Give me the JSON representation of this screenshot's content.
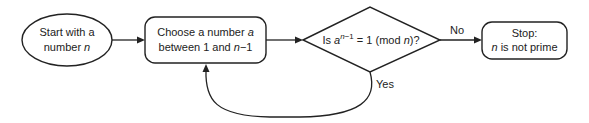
{
  "diagram": {
    "type": "flowchart",
    "nodes": {
      "start": {
        "shape": "ellipse",
        "line1": "Start with a",
        "line2_text": "number ",
        "line2_var": "n"
      },
      "choose": {
        "shape": "rounded-rectangle",
        "line1_text": "Choose a number ",
        "line1_var": "a",
        "line2_text": "between 1 and ",
        "line2_var": "n",
        "line2_suffix": "−1"
      },
      "test": {
        "shape": "diamond",
        "prefix": "Is ",
        "base": "a",
        "exp_var": "n",
        "exp_suffix": "−1",
        "middle": " = 1 (mod ",
        "mod_var": "n",
        "suffix": ")?"
      },
      "stop": {
        "shape": "rounded-rectangle",
        "line1": "Stop:",
        "line2_var": "n",
        "line2_text": " is not prime"
      }
    },
    "edges": {
      "start_to_choose": {
        "from": "start",
        "to": "choose",
        "label": ""
      },
      "choose_to_test": {
        "from": "choose",
        "to": "test",
        "label": ""
      },
      "test_to_stop": {
        "from": "test",
        "to": "stop",
        "label": "No"
      },
      "test_to_choose": {
        "from": "test",
        "to": "choose",
        "label": "Yes"
      }
    }
  }
}
